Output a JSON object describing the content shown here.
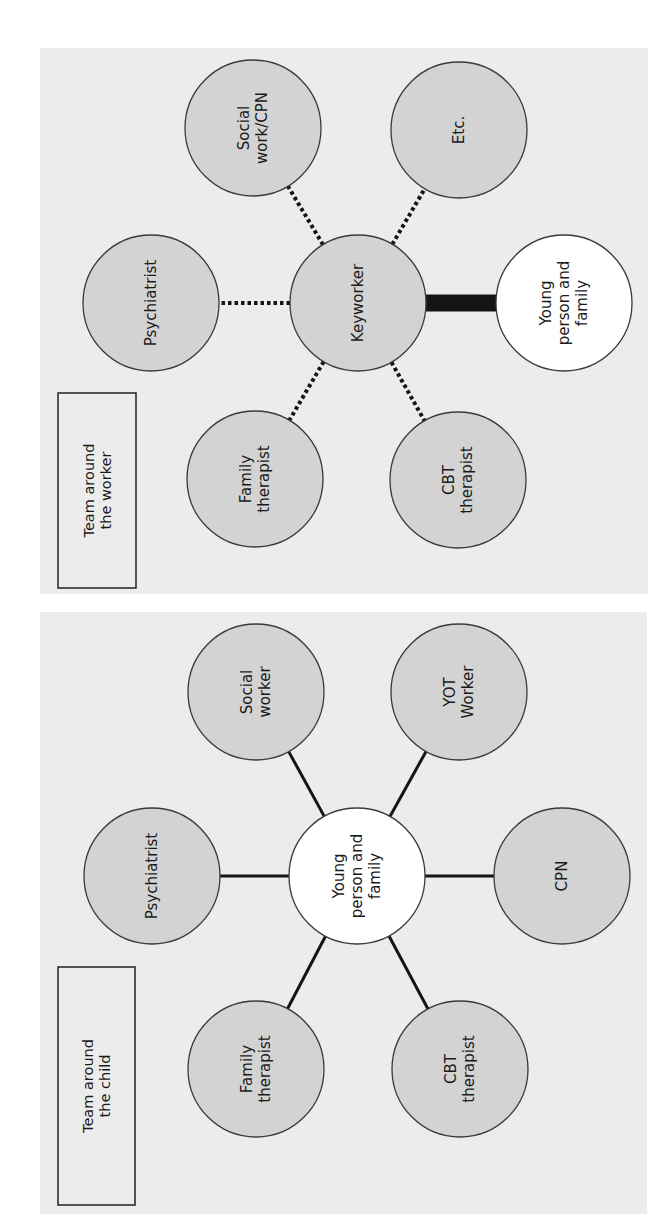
{
  "panels": [
    {
      "id": "team-around-the-worker",
      "title_lines": [
        "Team around",
        "the worker"
      ],
      "background": "#ececec",
      "bounds": {
        "x": 40,
        "y": 48,
        "w": 608,
        "h": 546
      },
      "title_box": {
        "x": 58,
        "y": 393,
        "w": 78,
        "h": 195
      },
      "center": {
        "label_lines": [
          "Keyworker"
        ],
        "cx": 358,
        "cy": 303,
        "fill": "#d3d3d3"
      },
      "nodes": [
        {
          "label_lines": [
            "Psychiatrist"
          ],
          "cx": 151,
          "cy": 303,
          "fill": "#d3d3d3",
          "link": "dotted"
        },
        {
          "label_lines": [
            "Social",
            "work/CPN"
          ],
          "cx": 253,
          "cy": 128,
          "fill": "#d3d3d3",
          "link": "dotted"
        },
        {
          "label_lines": [
            "Etc."
          ],
          "cx": 459,
          "cy": 130,
          "fill": "#d3d3d3",
          "link": "dotted"
        },
        {
          "label_lines": [
            "Family",
            "therapist"
          ],
          "cx": 255,
          "cy": 479,
          "fill": "#d3d3d3",
          "link": "dotted"
        },
        {
          "label_lines": [
            "CBT",
            "therapist"
          ],
          "cx": 458,
          "cy": 480,
          "fill": "#d3d3d3",
          "link": "dotted"
        },
        {
          "label_lines": [
            "Young",
            "person and",
            "family"
          ],
          "cx": 564,
          "cy": 303,
          "fill": "#ffffff",
          "link": "thick"
        }
      ]
    },
    {
      "id": "team-around-the-child",
      "title_lines": [
        "Team around",
        "the child"
      ],
      "background": "#ececec",
      "bounds": {
        "x": 40,
        "y": 612,
        "w": 607,
        "h": 602
      },
      "title_box": {
        "x": 58,
        "y": 967,
        "w": 77,
        "h": 238
      },
      "center": {
        "label_lines": [
          "Young",
          "person and",
          "family"
        ],
        "cx": 357,
        "cy": 876,
        "fill": "#ffffff"
      },
      "nodes": [
        {
          "label_lines": [
            "Psychiatrist"
          ],
          "cx": 152,
          "cy": 876,
          "fill": "#d3d3d3",
          "link": "solid"
        },
        {
          "label_lines": [
            "Social",
            "worker"
          ],
          "cx": 256,
          "cy": 692,
          "fill": "#d3d3d3",
          "link": "solid"
        },
        {
          "label_lines": [
            "YOT",
            "Worker"
          ],
          "cx": 459,
          "cy": 692,
          "fill": "#d3d3d3",
          "link": "solid"
        },
        {
          "label_lines": [
            "CPN"
          ],
          "cx": 562,
          "cy": 876,
          "fill": "#d3d3d3",
          "link": "solid"
        },
        {
          "label_lines": [
            "Family",
            "therapist"
          ],
          "cx": 256,
          "cy": 1069,
          "fill": "#d3d3d3",
          "link": "solid"
        },
        {
          "label_lines": [
            "CBT",
            "therapist"
          ],
          "cx": 460,
          "cy": 1069,
          "fill": "#d3d3d3",
          "link": "solid"
        }
      ]
    }
  ],
  "style": {
    "node_radius": 68,
    "stroke": "#3a3a3a",
    "link_color": "#141414"
  }
}
